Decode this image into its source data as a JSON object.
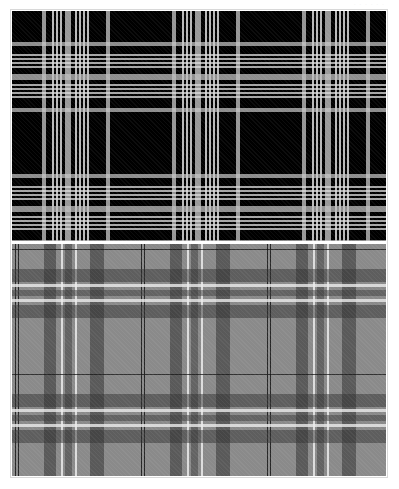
{
  "image": {
    "width": 399,
    "height": 489,
    "background": "#ffffff",
    "frame_border": "#d8d8d8"
  },
  "caption": {
    "text": "· · · · · ·"
  },
  "panels": [
    {
      "id": "dark-tartan",
      "description": "Black tartan with grey and white stripes",
      "ground_color": "#000000",
      "stripe_colors": [
        "#c8c8c8",
        "#e6e6e6",
        "#bebebe"
      ],
      "repeat_px": 130
    },
    {
      "id": "grey-tartan",
      "description": "Mid-grey tartan with dark grey bands, white pin stripes and fine black lines",
      "ground_color": "#8a8a8a",
      "stripe_colors": [
        "#323232",
        "#ebebeb",
        "#141414"
      ],
      "repeat_px": 126
    }
  ]
}
